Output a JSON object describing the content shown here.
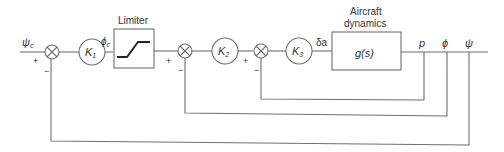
{
  "diagram": {
    "type": "block-diagram",
    "input": {
      "label": "ψ",
      "sub": "c"
    },
    "blocks": {
      "k1": {
        "label": "K",
        "sub": "1"
      },
      "limiter": {
        "title": "Limiter",
        "out_label": "ϕ",
        "out_sub": "c"
      },
      "k2": {
        "label": "K",
        "sub": "2"
      },
      "k3": {
        "label": "K",
        "sub": "3",
        "out_label": "δa"
      },
      "plant": {
        "title_line1": "Aircraft",
        "title_line2": "dynamics",
        "label": "g(s)"
      }
    },
    "summers": [
      {
        "id": "sum1",
        "plus": "+",
        "minus": "−"
      },
      {
        "id": "sum2",
        "plus": "+",
        "minus": "−"
      },
      {
        "id": "sum3",
        "plus": "+",
        "minus": "−"
      }
    ],
    "outputs": {
      "p": "p",
      "phi": "ϕ",
      "psi": "ψ"
    },
    "feedback": [
      {
        "from": "p",
        "to": "sum3"
      },
      {
        "from": "phi",
        "to": "sum2"
      },
      {
        "from": "psi",
        "to": "sum1"
      }
    ],
    "colors": {
      "line": "#6f6f6f",
      "text": "#333333"
    }
  }
}
